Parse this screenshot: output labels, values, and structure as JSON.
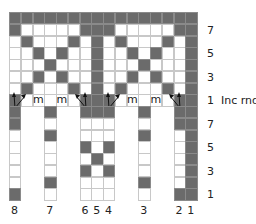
{
  "chart": {
    "colors": {
      "dark": "#6b6b6b",
      "light": "#ffffff",
      "grid": "#c8c8c8"
    },
    "grid": {
      "left": 9,
      "top": 12,
      "cell_w": 11.75,
      "cell_h": 11.75,
      "cols": 16
    },
    "top_section": {
      "rows": [
        {
          "row": 8,
          "dark": [
            0,
            1,
            2,
            3,
            4,
            5,
            6,
            7,
            8,
            9,
            10,
            11,
            12,
            13,
            14,
            15
          ]
        },
        {
          "row": 7,
          "dark": [
            0,
            6,
            7,
            8,
            14,
            15
          ],
          "label": "7"
        },
        {
          "row": 6,
          "dark": [
            1,
            5,
            7,
            9,
            13,
            15
          ]
        },
        {
          "row": 5,
          "dark": [
            2,
            4,
            7,
            10,
            12,
            15
          ],
          "label": "5"
        },
        {
          "row": 4,
          "dark": [
            3,
            7,
            11,
            15
          ]
        },
        {
          "row": 3,
          "dark": [
            2,
            4,
            7,
            10,
            12,
            15
          ],
          "label": "3"
        },
        {
          "row": 2,
          "dark": [
            1,
            5,
            7,
            9,
            13,
            15
          ]
        },
        {
          "row": 1,
          "dark": [
            0,
            6,
            7,
            8,
            14,
            15
          ],
          "label": "1  Inc rnd"
        }
      ],
      "inc_round": {
        "m_cols": [
          2,
          4,
          10,
          12
        ],
        "m_text": "m",
        "arrows": [
          {
            "col": 0,
            "dir": "up-right"
          },
          {
            "col": 6,
            "dir": "up-left"
          },
          {
            "col": 8,
            "dir": "up-right"
          },
          {
            "col": 14,
            "dir": "up-left"
          }
        ]
      }
    },
    "bottom_section": {
      "columns": [
        {
          "col": 0,
          "label": "8",
          "cells": [
            1,
            1,
            0,
            0,
            0,
            0,
            0,
            1
          ]
        },
        {
          "col": 3,
          "label": "7",
          "cells": [
            1,
            0,
            1,
            0,
            0,
            0,
            1,
            0
          ]
        },
        {
          "col": 6,
          "label": "6",
          "cells": [
            1,
            0,
            0,
            1,
            0,
            1,
            0,
            0
          ]
        },
        {
          "col": 7,
          "label": "5",
          "cells": [
            1,
            0,
            0,
            0,
            1,
            0,
            0,
            0
          ]
        },
        {
          "col": 8,
          "label": "4",
          "cells": [
            1,
            0,
            0,
            1,
            0,
            1,
            0,
            0
          ]
        },
        {
          "col": 11,
          "label": "3",
          "cells": [
            1,
            0,
            1,
            0,
            0,
            0,
            1,
            0
          ]
        },
        {
          "col": 14,
          "label": "2",
          "cells": [
            1,
            1,
            0,
            0,
            0,
            0,
            0,
            1
          ]
        },
        {
          "col": 15,
          "label": "1",
          "cells": [
            1,
            1,
            1,
            1,
            1,
            1,
            1,
            1
          ]
        }
      ],
      "row_labels": [
        {
          "index": 1,
          "text": "7"
        },
        {
          "index": 3,
          "text": "5"
        },
        {
          "index": 5,
          "text": "3"
        },
        {
          "index": 7,
          "text": "1"
        }
      ]
    }
  }
}
